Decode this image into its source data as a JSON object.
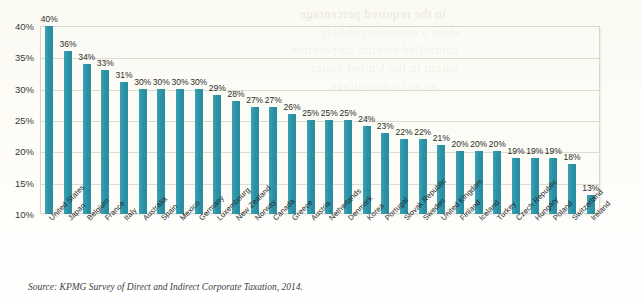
{
  "chart_data": {
    "type": "bar",
    "title": "",
    "subtitle": "",
    "xlabel": "",
    "ylabel": "",
    "ylim": [
      10,
      40
    ],
    "grid": true,
    "legend": "none",
    "orientation": "vertical",
    "bar_color": "#2e95a8",
    "value_suffix": "%",
    "categories": [
      "United States",
      "Japan",
      "Belgium",
      "France",
      "Italy",
      "Australia",
      "Spain",
      "Mexico",
      "Germany",
      "Luxembourg",
      "New Zealand",
      "Norway",
      "Canada",
      "Greece",
      "Austria",
      "Netherlands",
      "Denmark",
      "Korea",
      "Portugal",
      "Slovak Republic",
      "Sweden",
      "United Kingdom",
      "Finland",
      "Iceland",
      "Turkey",
      "Czech Republic",
      "Hungary",
      "Poland",
      "Switzerland",
      "Ireland"
    ],
    "values": [
      40,
      36,
      34,
      33,
      31,
      30,
      30,
      30,
      30,
      29,
      28,
      27,
      27,
      26,
      25,
      25,
      25,
      24,
      23,
      22,
      22,
      21,
      20,
      20,
      20,
      19,
      19,
      19,
      18,
      13
    ],
    "value_labels": [
      "40%",
      "36%",
      "34%",
      "33%",
      "31%",
      "30%",
      "30%",
      "30%",
      "30%",
      "29%",
      "28%",
      "27%",
      "27%",
      "26%",
      "25%",
      "25%",
      "25%",
      "24%",
      "23%",
      "22%",
      "22%",
      "21%",
      "20%",
      "20%",
      "20%",
      "19%",
      "19%",
      "19%",
      "18%",
      "13%"
    ],
    "y_ticks": [
      40,
      35,
      30,
      25,
      20,
      15,
      10
    ],
    "y_tick_labels": [
      "40%",
      "35%",
      "30%",
      "25%",
      "20%",
      "15%",
      "10%"
    ]
  },
  "source": {
    "text": "Source: KPMG Survey of Direct and Indirect Corporate Taxation, 2014."
  },
  "page_bleed": {
    "lines": [
      "in the required percentage",
      "share a common publicly",
      "controlled foreign corporation",
      "parent in the United States",
      "so as to discourage"
    ]
  }
}
